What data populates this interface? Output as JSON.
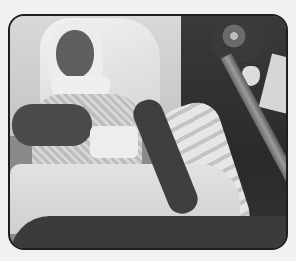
{
  "image": {
    "description": "Grayscale photograph in a rounded-corner frame showing a person with a bandaged head and neck lying in a hospital bed, wrapped arm and leg, with flowers on a bedside table and a bed rail on the right",
    "colors": {
      "background": "#f1f1f1",
      "frame_border": "#1e1e1e"
    },
    "elements": [
      "patient-head-bandage",
      "patient-face",
      "neck-brace",
      "patterned-gown",
      "bandaged-hand",
      "bandaged-leg",
      "blanket",
      "flower-bouquet",
      "vase",
      "bed-rail",
      "pillow"
    ]
  }
}
